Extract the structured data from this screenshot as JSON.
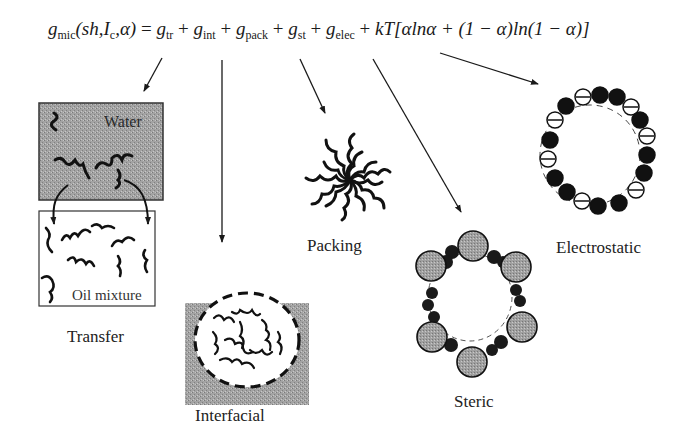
{
  "formula": {
    "lhs_symbol": "g",
    "lhs_sub": "mic",
    "lhs_args": "(sh,I",
    "lhs_args_sub": "c",
    "lhs_args_end": ",α)",
    "equals": " = ",
    "terms": [
      {
        "symbol": "g",
        "sub": "tr"
      },
      {
        "symbol": "g",
        "sub": "int"
      },
      {
        "symbol": "g",
        "sub": "pack"
      },
      {
        "symbol": "g",
        "sub": "st"
      },
      {
        "symbol": "g",
        "sub": "elec"
      }
    ],
    "plus": " + ",
    "mixing_term": "kT[αlnα + (1 − α)ln(1 − α)]"
  },
  "panels": {
    "transfer": {
      "label": "Transfer",
      "water_label": "Water",
      "oil_label": "Oil mixture"
    },
    "interfacial": {
      "label": "Interfacial"
    },
    "packing": {
      "label": "Packing"
    },
    "steric": {
      "label": "Steric"
    },
    "electrostatic": {
      "label": "Electrostatic"
    }
  },
  "colors": {
    "ink": "#1a1a1a",
    "gray_fill": "#a8a8a8",
    "water_fill": "#9a9a9a",
    "background": "#ffffff"
  }
}
